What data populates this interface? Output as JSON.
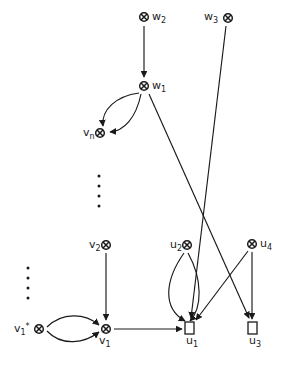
{
  "figure": {
    "type": "directed-graph-diagram",
    "background_color": "#ffffff",
    "stroke_color": "#1a1a1a",
    "node_marker_crossed_circle": "crossed-circle",
    "node_marker_square": "open-square"
  },
  "nodes": [
    {
      "id": "w2",
      "base": "w",
      "sub": "2",
      "sup": "",
      "marker": "crossed-circle",
      "label_side": "right",
      "cx": 144,
      "cy": 17,
      "label_x": 152,
      "label_y": 12
    },
    {
      "id": "w3",
      "base": "w",
      "sub": "3",
      "sup": "",
      "marker": "crossed-circle",
      "label_side": "left",
      "cx": 228,
      "cy": 18,
      "label_x": 205,
      "label_y": 12
    },
    {
      "id": "w1",
      "base": "w",
      "sub": "1",
      "sup": "",
      "marker": "crossed-circle",
      "label_side": "right",
      "cx": 144,
      "cy": 86,
      "label_x": 152,
      "label_y": 81
    },
    {
      "id": "vn",
      "base": "v",
      "sub": "n",
      "sup": "",
      "marker": "crossed-circle",
      "label_side": "left",
      "cx": 100,
      "cy": 133,
      "label_x": 83,
      "label_y": 128
    },
    {
      "id": "v2",
      "base": "v",
      "sub": "2",
      "sup": "",
      "marker": "crossed-circle",
      "label_side": "left",
      "cx": 106,
      "cy": 245,
      "label_x": 89,
      "label_y": 240
    },
    {
      "id": "u2",
      "base": "u",
      "sub": "2",
      "sup": "",
      "marker": "crossed-circle",
      "label_side": "left",
      "cx": 187,
      "cy": 245,
      "label_x": 170,
      "label_y": 240
    },
    {
      "id": "u4",
      "base": "u",
      "sub": "4",
      "sup": "",
      "marker": "crossed-circle",
      "label_side": "right",
      "cx": 252,
      "cy": 244,
      "label_x": 260,
      "label_y": 239
    },
    {
      "id": "v1s",
      "base": "v",
      "sub": "1",
      "sup": "*",
      "marker": "crossed-circle",
      "label_side": "left",
      "cx": 39,
      "cy": 329,
      "label_x": 14,
      "label_y": 324
    },
    {
      "id": "v1",
      "base": "v",
      "sub": "1",
      "sup": "",
      "marker": "crossed-circle",
      "label_side": "below",
      "cx": 106,
      "cy": 329,
      "label_x": 99,
      "label_y": 338
    },
    {
      "id": "u1",
      "base": "u",
      "sub": "1",
      "sup": "",
      "marker": "open-square",
      "label_side": "below",
      "cx": 189,
      "cy": 329,
      "label_x": 187,
      "label_y": 338
    },
    {
      "id": "u3",
      "base": "u",
      "sub": "3",
      "sup": "",
      "marker": "open-square",
      "label_side": "below",
      "cx": 252,
      "cy": 329,
      "label_x": 250,
      "label_y": 338
    }
  ],
  "edges": [
    {
      "id": "w2-w1",
      "from": "w2",
      "to": "w1",
      "shape": "straight",
      "arrow": true
    },
    {
      "id": "w1-vn-a",
      "from": "w1",
      "to": "vn",
      "shape": "curve-upper",
      "arrow": true
    },
    {
      "id": "w1-vn-b",
      "from": "w1",
      "to": "vn",
      "shape": "curve-lower",
      "arrow": true
    },
    {
      "id": "w1-u3",
      "from": "w1",
      "to": "u3",
      "shape": "straight",
      "arrow": true
    },
    {
      "id": "w3-u1",
      "from": "w3",
      "to": "u1",
      "shape": "straight",
      "arrow": true
    },
    {
      "id": "v2-v1",
      "from": "v2",
      "to": "v1",
      "shape": "straight",
      "arrow": true
    },
    {
      "id": "v1s-v1-a",
      "from": "v1s",
      "to": "v1",
      "shape": "curve-upper",
      "arrow": true
    },
    {
      "id": "v1s-v1-b",
      "from": "v1s",
      "to": "v1",
      "shape": "curve-lower",
      "arrow": true
    },
    {
      "id": "v1-u1",
      "from": "v1",
      "to": "u1",
      "shape": "straight",
      "arrow": true
    },
    {
      "id": "u2-u1-a",
      "from": "u2",
      "to": "u1",
      "shape": "curve-left",
      "arrow": true
    },
    {
      "id": "u2-u1-b",
      "from": "u2",
      "to": "u1",
      "shape": "curve-right",
      "arrow": true
    },
    {
      "id": "u4-u1",
      "from": "u4",
      "to": "u1",
      "shape": "straight",
      "arrow": true
    },
    {
      "id": "u4-u3",
      "from": "u4",
      "to": "u3",
      "shape": "straight",
      "arrow": true
    }
  ],
  "ellipses": [
    {
      "id": "ellipsis-upper",
      "x": 99,
      "y_start": 176,
      "count": 4,
      "spacing": 10
    },
    {
      "id": "ellipsis-lower",
      "x": 28,
      "y_start": 268,
      "count": 4,
      "spacing": 10
    }
  ]
}
